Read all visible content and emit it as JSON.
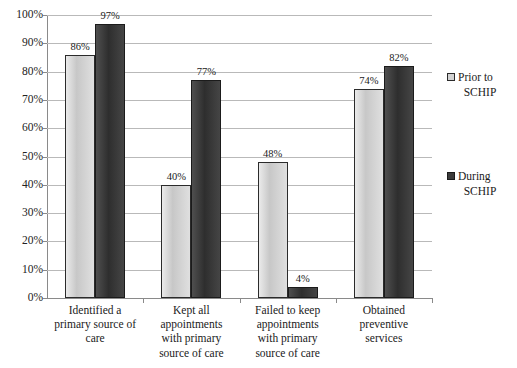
{
  "chart_data": {
    "type": "bar",
    "title": "",
    "subtitle": "",
    "xlabel": "",
    "ylabel": "",
    "ylim": [
      0,
      100
    ],
    "y_unit": "%",
    "grid": true,
    "legend_position": "right",
    "categories": [
      "Identified a primary source of care",
      "Kept all appointments with primary source of care",
      "Failed to keep appointments with primary source of care",
      "Obtained preventive services"
    ],
    "category_lines": [
      [
        "Identified a",
        "primary source of",
        "care"
      ],
      [
        "Kept all",
        "appointments",
        "with primary",
        "source of care"
      ],
      [
        "Failed to keep",
        "appointments",
        "with primary",
        "source of care"
      ],
      [
        "Obtained",
        "preventive",
        "services"
      ]
    ],
    "series": [
      {
        "name": "Prior to SCHIP",
        "color": "#d2d2d2",
        "values": [
          86,
          40,
          48,
          74
        ],
        "value_labels": [
          "86%",
          "40%",
          "48%",
          "74%"
        ]
      },
      {
        "name": "During SCHIP",
        "color": "#3b3b3b",
        "values": [
          97,
          77,
          4,
          82
        ],
        "value_labels": [
          "97%",
          "77%",
          "4%",
          "82%"
        ]
      }
    ],
    "y_ticks": [
      0,
      10,
      20,
      30,
      40,
      50,
      60,
      70,
      80,
      90,
      100
    ],
    "y_tick_labels": [
      "0%",
      "10%",
      "20%",
      "30%",
      "40%",
      "50%",
      "60%",
      "70%",
      "80%",
      "90%",
      "100%"
    ]
  },
  "legend": {
    "entries": [
      {
        "label": "Prior to SCHIP",
        "line1": "Prior to",
        "line2": "SCHIP",
        "swatch": "light-swatch"
      },
      {
        "label": "During SCHIP",
        "line1": "During",
        "line2": "SCHIP",
        "swatch": "dark-swatch"
      }
    ]
  }
}
